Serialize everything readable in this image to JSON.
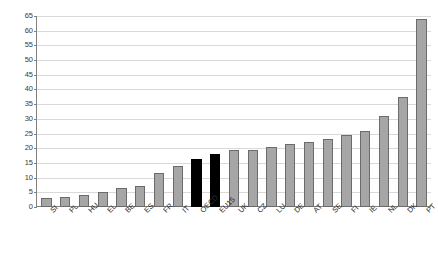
{
  "chart_data": {
    "type": "bar",
    "title": "",
    "subtitle": "",
    "xlabel": "",
    "ylabel": "",
    "ylim": [
      0,
      65
    ],
    "ytick_step": 5,
    "grid": true,
    "legend": "none",
    "yticks": [
      "0",
      "5",
      "10",
      "15",
      "20",
      "25",
      "30",
      "35",
      "40",
      "45",
      "50",
      "55",
      "60",
      "65"
    ],
    "categories": [
      "SI",
      "PL",
      "HU",
      "EL",
      "BE",
      "ES",
      "FR",
      "IT",
      "OECD",
      "EU15",
      "UK",
      "CZ",
      "LU",
      "DE",
      "AT",
      "SE",
      "FI",
      "IE",
      "NL",
      "DK",
      "PT"
    ],
    "values": [
      3,
      3.5,
      4,
      5,
      6.5,
      7,
      11.5,
      14,
      16.5,
      18,
      19.5,
      19.5,
      20.5,
      21.5,
      22,
      23,
      24.5,
      26,
      31,
      37.5,
      64
    ],
    "highlight_categories": [
      "OECD",
      "EU15"
    ],
    "colors": {
      "bar_fill": "#a6a6a6",
      "bar_border": "#6b6b6b",
      "highlight_fill": "#000000",
      "gridline": "#d9d9d9",
      "axis": "#808080",
      "text": "#2b2b2b",
      "background": "#ffffff"
    }
  }
}
